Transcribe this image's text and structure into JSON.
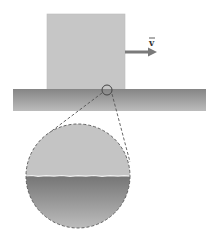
{
  "diagram": {
    "block": {
      "x": 47,
      "y": 14,
      "width": 78,
      "height": 75,
      "color": "#c4c4c4"
    },
    "surface": {
      "x": 13,
      "y": 89,
      "width": 193,
      "height": 22,
      "color_top": "#8a8a8a",
      "color_bottom": "#b8b8b8"
    },
    "velocity_arrow": {
      "label": "v",
      "from_x": 125,
      "to_x": 157,
      "y": 52,
      "color": "#777777"
    },
    "contact_marker": {
      "cx": 107,
      "cy": 90,
      "r": 5
    },
    "magnified_view": {
      "cx": 78,
      "cy": 176,
      "r": 52,
      "top_color": "#c4c4c4",
      "bottom_color_top": "#7c7c7c",
      "bottom_color_bottom": "#bdbdbd",
      "interface_color": "#f2f2f2"
    },
    "leader_lines": [
      {
        "x1": 102,
        "y1": 93,
        "x2": 49,
        "y2": 133
      },
      {
        "x1": 112,
        "y1": 94,
        "x2": 130,
        "y2": 162
      }
    ]
  }
}
